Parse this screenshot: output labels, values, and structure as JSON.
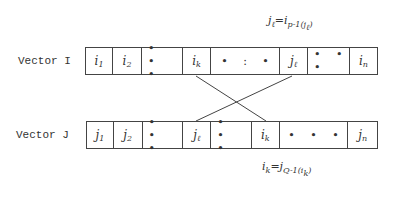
{
  "diagram": {
    "vector_i": {
      "label": "Vector I",
      "cells": [
        {
          "base": "i",
          "sub": "1"
        },
        {
          "base": "i",
          "sub": "2"
        },
        {
          "dots": "• • •"
        },
        {
          "base": "i",
          "sub": "k"
        },
        {
          "dots": "• : •"
        },
        {
          "base": "j",
          "sub": "ℓ"
        },
        {
          "dots": "• • •"
        },
        {
          "base": "i",
          "sub": "n"
        }
      ]
    },
    "vector_j": {
      "label": "Vector J",
      "cells": [
        {
          "base": "j",
          "sub": "1"
        },
        {
          "base": "j",
          "sub": "2"
        },
        {
          "dots": "• • •"
        },
        {
          "base": "j",
          "sub": "ℓ"
        },
        {
          "dots": "• • •"
        },
        {
          "base": "i",
          "sub": "k"
        },
        {
          "dots": "• • •"
        },
        {
          "base": "j",
          "sub": "n"
        }
      ]
    },
    "formula_top": {
      "lhs": "j",
      "lhs_sub": "ℓ",
      "eq": "=i",
      "sub": "p-1",
      "arg": "(j",
      "arg_sub": "ℓ",
      "close": ")"
    },
    "formula_bottom": {
      "lhs": "i",
      "lhs_sub": "k",
      "eq": "=j",
      "sub": "Q-1",
      "arg": "(i",
      "arg_sub": "k",
      "close": ")"
    },
    "edges": [
      {
        "from": "vector_i.cell_i_k",
        "to": "vector_j.cell_i_k"
      },
      {
        "from": "vector_i.cell_j_l",
        "to": "vector_j.cell_j_l"
      }
    ],
    "colors": {
      "line": "#444444",
      "text": "#333333",
      "background": "#ffffff"
    }
  }
}
